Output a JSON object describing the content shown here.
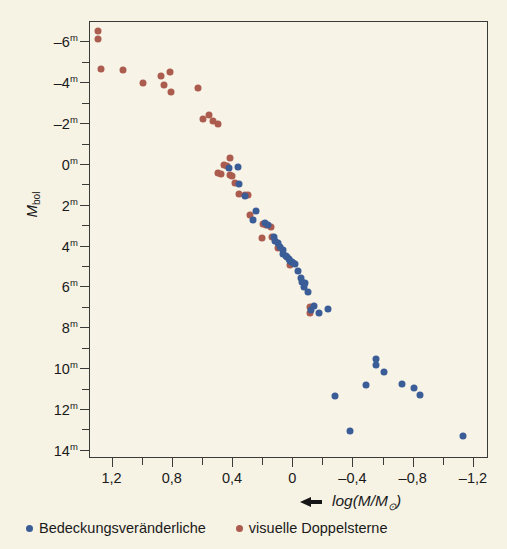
{
  "figure": {
    "background_color": "#f6f2e4",
    "series_colors": {
      "eclipsing_binaries": "#3a5d97",
      "visual_binaries": "#ab5c4f"
    }
  },
  "axes": {
    "y_title_main": "M",
    "y_title_sub": "bol",
    "y_arrow": "down-arrow",
    "x_title": "log(M/M",
    "x_title_sub": "⊙",
    "x_title_end": ")",
    "x_arrow": "left-arrow",
    "y_ticks": [
      "–6",
      "–4",
      "–2",
      "0",
      "2",
      "4",
      "6",
      "8",
      "10",
      "12",
      "14"
    ],
    "y_tick_sup": "m",
    "x_ticks": [
      "1,2",
      "0,8",
      "0,4",
      "0",
      "–0,4",
      "–0,8",
      "–1,2"
    ]
  },
  "legend": {
    "items": [
      {
        "label": "Bedeckungsveränderliche",
        "color": "#3a5d97",
        "marker": "dot-blue"
      },
      {
        "label": "visuelle Doppelsterne",
        "color": "#ab5c4f",
        "marker": "dot-red"
      }
    ]
  },
  "chart_data": {
    "type": "scatter",
    "title": "",
    "xlabel": "log(M/M⊙)",
    "ylabel": "M_bol",
    "xlim": [
      1.35,
      -1.3
    ],
    "ylim": [
      -7.0,
      14.4
    ],
    "x_reversed": true,
    "y_reversed": true,
    "grid": false,
    "legend_position": "below-axes",
    "series": [
      {
        "name": "visuelle Doppelsterne",
        "color": "#ab5c4f",
        "points": [
          [
            1.3,
            -6.55
          ],
          [
            1.3,
            -6.15
          ],
          [
            1.28,
            -4.7
          ],
          [
            1.13,
            -4.65
          ],
          [
            1.0,
            -4.0
          ],
          [
            0.88,
            -4.35
          ],
          [
            0.86,
            -3.9
          ],
          [
            0.82,
            -4.55
          ],
          [
            0.81,
            -3.55
          ],
          [
            0.63,
            -3.75
          ],
          [
            0.56,
            -2.45
          ],
          [
            0.53,
            -2.15
          ],
          [
            0.6,
            -2.25
          ],
          [
            0.5,
            -2.0
          ],
          [
            0.42,
            -0.35
          ],
          [
            0.46,
            0.0
          ],
          [
            0.44,
            0.05
          ],
          [
            0.48,
            0.45
          ],
          [
            0.42,
            0.5
          ],
          [
            0.41,
            0.55
          ],
          [
            0.5,
            0.4
          ],
          [
            0.39,
            0.9
          ],
          [
            0.36,
            1.4
          ],
          [
            0.32,
            1.45
          ],
          [
            0.3,
            1.45
          ],
          [
            0.29,
            2.45
          ],
          [
            0.2,
            2.9
          ],
          [
            0.18,
            2.95
          ],
          [
            0.15,
            3.05
          ],
          [
            0.21,
            3.6
          ],
          [
            0.14,
            3.55
          ],
          [
            0.1,
            4.05
          ],
          [
            0.02,
            4.9
          ],
          [
            -0.11,
            6.95
          ],
          [
            -0.11,
            7.25
          ]
        ]
      },
      {
        "name": "Bedeckungsveränderliche",
        "color": "#3a5d97",
        "points": [
          [
            0.43,
            0.15
          ],
          [
            0.37,
            0.1
          ],
          [
            0.36,
            0.95
          ],
          [
            0.32,
            1.5
          ],
          [
            0.25,
            2.25
          ],
          [
            0.27,
            2.7
          ],
          [
            0.19,
            2.85
          ],
          [
            0.17,
            2.95
          ],
          [
            0.13,
            3.55
          ],
          [
            0.12,
            3.7
          ],
          [
            0.1,
            3.8
          ],
          [
            0.09,
            4.0
          ],
          [
            0.07,
            4.15
          ],
          [
            0.07,
            4.35
          ],
          [
            0.05,
            4.45
          ],
          [
            0.04,
            4.5
          ],
          [
            0.03,
            4.6
          ],
          [
            0.02,
            4.7
          ],
          [
            0.01,
            4.75
          ],
          [
            0.0,
            4.8
          ],
          [
            -0.01,
            4.85
          ],
          [
            -0.03,
            5.2
          ],
          [
            -0.05,
            5.55
          ],
          [
            -0.06,
            5.75
          ],
          [
            -0.08,
            5.8
          ],
          [
            -0.07,
            6.0
          ],
          [
            -0.1,
            6.2
          ],
          [
            -0.14,
            6.9
          ],
          [
            -0.12,
            7.1
          ],
          [
            -0.17,
            7.25
          ],
          [
            -0.23,
            7.05
          ],
          [
            -0.55,
            9.5
          ],
          [
            -0.55,
            9.8
          ],
          [
            -0.6,
            10.15
          ],
          [
            -0.72,
            10.75
          ],
          [
            -0.8,
            10.9
          ],
          [
            -0.84,
            11.25
          ],
          [
            -0.48,
            10.8
          ],
          [
            -0.28,
            11.3
          ],
          [
            -0.38,
            13.05
          ],
          [
            -1.13,
            13.25
          ]
        ]
      }
    ]
  }
}
